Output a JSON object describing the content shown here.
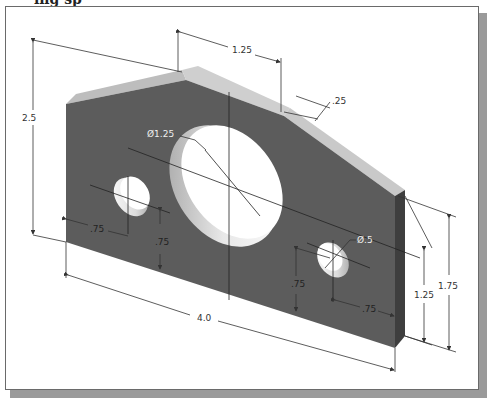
{
  "heading_fragment": "ing sp",
  "colors": {
    "face": "#5c5c5c",
    "top_face": "#c8c8c8",
    "side_face": "#444444",
    "hole": "#ffffff",
    "dimension_line": "#333333",
    "frame_border": "#6a6a6a",
    "shadow": "#9a9a9a"
  },
  "dimensions": {
    "overall_height": "2.5",
    "top_flat_width": "1.25",
    "chamfer": ".25",
    "large_hole_diameter": "Ø1.25",
    "small_hole_diameter": "Ø.5",
    "left_hole_x": ".75",
    "left_hole_y": ".75",
    "right_hole_y": ".75",
    "right_hole_x": ".75",
    "right_edge_height": "1.25",
    "right_overall_height": "1.75",
    "overall_length": "4.0"
  }
}
